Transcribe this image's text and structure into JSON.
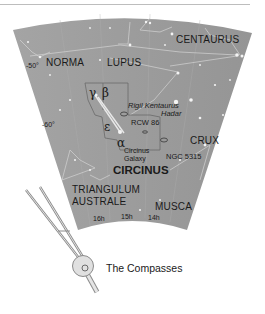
{
  "map": {
    "constellations": {
      "centaurus": "CENTAURUS",
      "norma": "NORMA",
      "lupus": "LUPUS",
      "crux": "CRUX",
      "circinus": "CIRCINUS",
      "triangulum_line1": "TRIANGULUM",
      "triangulum_line2": "AUSTRALE",
      "musca": "MUSCA"
    },
    "declination": {
      "minus50": "-50°",
      "minus60": "-60°"
    },
    "right_ascension": {
      "h16": "16h",
      "h15": "15h",
      "h14": "14h"
    },
    "stars": {
      "gamma": "γ",
      "beta": "β",
      "epsilon": "ε",
      "alpha": "α",
      "rigil": "Rigil Kentaurus",
      "hadar": "Hadar"
    },
    "objects": {
      "rcw86": "RCW 86",
      "ngc5315": "NGC 5315",
      "circinus_galaxy_line1": "Circinus",
      "circinus_galaxy_line2": "Galaxy"
    },
    "colors": {
      "sky": "#9a9a9a",
      "text": "#1a1a1a",
      "lines": "#d8d8d8"
    }
  },
  "illustration": {
    "caption": "The Compasses"
  }
}
